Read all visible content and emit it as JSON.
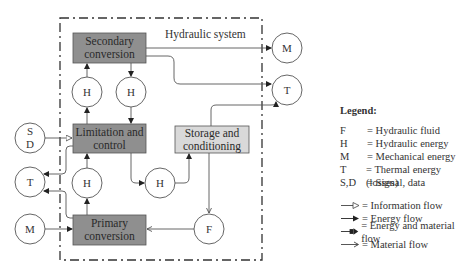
{
  "diagram": {
    "system_title": "Hydraulic system",
    "blocks": {
      "secondary": "Secondary conversion",
      "limitation": "Limitation and control",
      "primary": "Primary conversion",
      "storage": "Storage and conditioning"
    },
    "circles": {
      "h1": "H",
      "h2": "H",
      "h3": "H",
      "h4": "H",
      "f": "F",
      "sd_s": "S",
      "sd_d": "D",
      "t_left": "T",
      "m_left": "M",
      "m_right": "M",
      "t_right": "T"
    },
    "colors": {
      "dark_block": "#8f8f8f",
      "light_block": "#d9d9d9",
      "line": "#555555"
    }
  },
  "legend": {
    "title": "Legend:",
    "symbols": [
      {
        "key": "F",
        "desc": "= Hydraulic fluid"
      },
      {
        "key": "H",
        "desc": "= Hydraulic energy"
      },
      {
        "key": "M",
        "desc": "= Mechanical energy"
      },
      {
        "key": "T",
        "desc": "= Thermal energy (losses)"
      },
      {
        "key": "S,D",
        "desc": "= Signal, data"
      }
    ],
    "flows": [
      {
        "type": "information",
        "desc": "= Information flow"
      },
      {
        "type": "energy",
        "desc": "= Energy flow"
      },
      {
        "type": "energy-material",
        "desc": "= Energy and material flow"
      },
      {
        "type": "material",
        "desc": "= Material flow"
      }
    ]
  }
}
